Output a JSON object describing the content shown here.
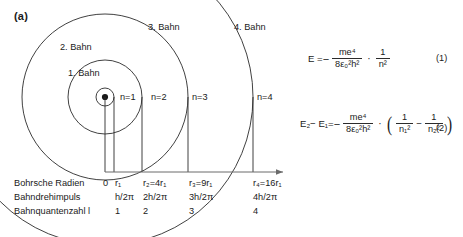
{
  "figure": {
    "panel_label": "(a)",
    "orbits": [
      {
        "name": "1. Bahn",
        "n_label": "n=1"
      },
      {
        "name": "2. Bahn",
        "n_label": "n=2"
      },
      {
        "name": "3. Bahn",
        "n_label": "n=3"
      },
      {
        "name": "4. Bahn",
        "n_label": "n=4"
      }
    ],
    "nucleus": "nucleus-dot",
    "axis": "horizontal-axis-arrow"
  },
  "table": {
    "rows": [
      {
        "label": "Bohrsche Radien",
        "cells": [
          "0",
          "r₁",
          "r₂=4r₁",
          "r₃=9r₁",
          "r₄=16r₁"
        ]
      },
      {
        "label": "Bahndrehimpuls",
        "cells": [
          "",
          "h/2π",
          "2h/2π",
          "3h/2π",
          "4h/2π"
        ]
      },
      {
        "label": "Bahnquantenzahl l",
        "cells": [
          "",
          "1",
          "2",
          "3",
          "4"
        ]
      }
    ]
  },
  "equations": [
    {
      "id": "eq1",
      "lhs": "E =",
      "sign": "−",
      "numerator": "me⁴",
      "denominator": "8ε₀²h²",
      "operator": "·",
      "factor_numerator": "1",
      "factor_denominator": "n²",
      "tag": "(1)"
    },
    {
      "id": "eq2",
      "lhs": "E₂− E₁=",
      "sign": "−",
      "numerator": "me⁴",
      "denominator": "8ε₀²h²",
      "operator": "·",
      "term1_numerator": "1",
      "term1_denominator": "n₁²",
      "term_minus": "−",
      "term2_numerator": "1",
      "term2_denominator": "n₂²",
      "tag": "(2)"
    }
  ],
  "colors": {
    "stroke": "#2b2b2b",
    "text": "#1a1a1a",
    "background": "#ffffff"
  }
}
